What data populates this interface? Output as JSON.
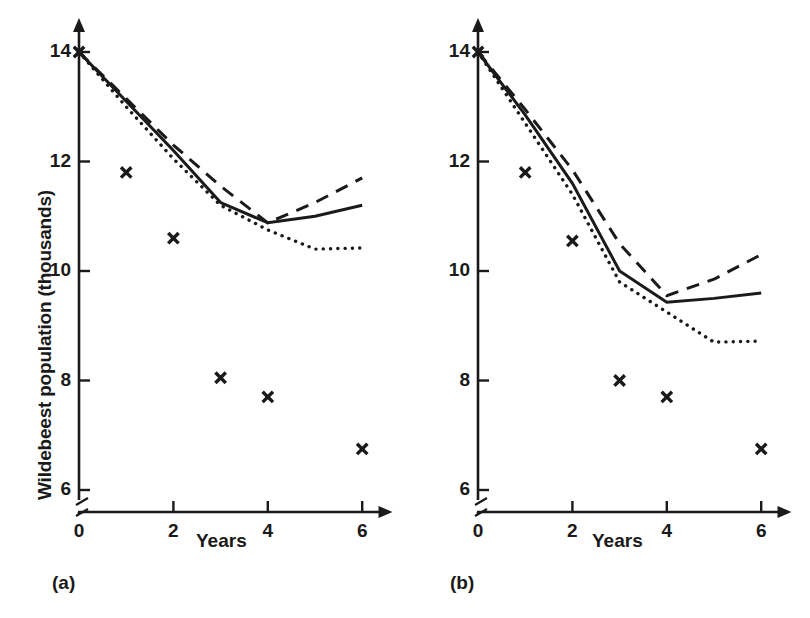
{
  "figure": {
    "ylabel": "Wildebeest population (thousands)",
    "xlabel_a": "Years",
    "xlabel_b": "Years",
    "panel_a_label": "(a)",
    "panel_b_label": "(b)",
    "line_color": "#1a1a1a",
    "background": "#ffffff"
  },
  "chart_data": [
    {
      "type": "line",
      "panel": "(a)",
      "title": "",
      "xlabel": "Years",
      "ylabel": "Wildebeest population (thousands)",
      "xlim": [
        0,
        6.6
      ],
      "ylim": [
        5.6,
        14.6
      ],
      "xticks": [
        0,
        2,
        4,
        6
      ],
      "xtick_labels": [
        "0",
        "2",
        "4",
        "6"
      ],
      "yticks": [
        6,
        8,
        10,
        12,
        14
      ],
      "ytick_labels": [
        "6",
        "8",
        "10",
        "12",
        "14"
      ],
      "grid": false,
      "legend": "none",
      "y_axis_break": true,
      "y_axis_break_below": 6,
      "x": [
        0,
        1,
        2,
        3,
        4,
        5,
        6
      ],
      "series": [
        {
          "name": "solid",
          "style": "solid",
          "values": [
            14.0,
            13.1,
            12.2,
            11.25,
            10.88,
            11.0,
            11.2
          ]
        },
        {
          "name": "dashed",
          "style": "dashed",
          "values": [
            14.0,
            13.15,
            12.3,
            11.55,
            10.88,
            11.25,
            11.7
          ]
        },
        {
          "name": "dotted",
          "style": "dotted",
          "values": [
            14.0,
            13.0,
            12.05,
            11.2,
            10.75,
            10.4,
            10.42
          ]
        }
      ],
      "scatter": {
        "name": "observed",
        "marker": "x",
        "x": [
          0,
          1,
          2,
          3,
          4,
          6
        ],
        "values": [
          14.0,
          11.8,
          10.6,
          8.05,
          7.7,
          6.75
        ]
      }
    },
    {
      "type": "line",
      "panel": "(b)",
      "title": "",
      "xlabel": "Years",
      "ylabel": "Wildebeest population (thousands)",
      "xlim": [
        0,
        6.6
      ],
      "ylim": [
        5.6,
        14.6
      ],
      "xticks": [
        0,
        2,
        4,
        6
      ],
      "xtick_labels": [
        "0",
        "2",
        "4",
        "6"
      ],
      "yticks": [
        6,
        8,
        10,
        12,
        14
      ],
      "ytick_labels": [
        "6",
        "8",
        "10",
        "12",
        "14"
      ],
      "grid": false,
      "legend": "none",
      "y_axis_break": true,
      "y_axis_break_below": 6,
      "x": [
        0,
        1,
        2,
        3,
        4,
        5,
        6
      ],
      "series": [
        {
          "name": "solid",
          "style": "solid",
          "values": [
            14.0,
            12.85,
            11.6,
            10.0,
            9.43,
            9.5,
            9.6
          ]
        },
        {
          "name": "dashed",
          "style": "dashed",
          "values": [
            14.0,
            12.95,
            11.85,
            10.5,
            9.55,
            9.85,
            10.3
          ]
        },
        {
          "name": "dotted",
          "style": "dotted",
          "values": [
            14.0,
            12.7,
            11.4,
            9.8,
            9.25,
            8.7,
            8.72
          ]
        }
      ],
      "scatter": {
        "name": "observed",
        "marker": "x",
        "x": [
          0,
          1,
          2,
          3,
          4,
          6
        ],
        "values": [
          14.0,
          11.8,
          10.55,
          8.0,
          7.7,
          6.75
        ]
      }
    }
  ]
}
